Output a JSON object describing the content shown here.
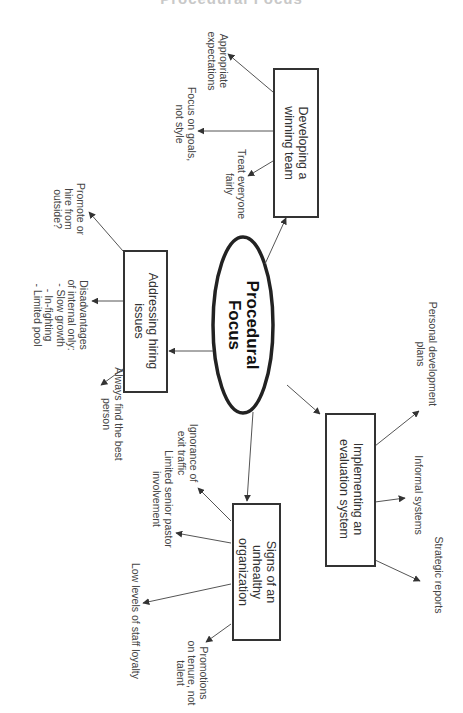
{
  "header": {
    "title": "Procedural Focus"
  },
  "center": {
    "label": "Procedural\nFocus"
  },
  "branches": [
    {
      "label": "Developing a\nwinning team",
      "leaves": [
        "Appropriate\nexpectations",
        "Focus on goals,\nnot style",
        "Treat everyone\nfairly"
      ]
    },
    {
      "label": "Addressing hiring\nissues",
      "leaves": [
        "Promote or\nhire from\noutside?",
        "Disadvantages\nof internal only:\n- Slow growth\n- In-fighting\n- Limited pool",
        "Always find the best\nperson"
      ]
    },
    {
      "label": "Implementing an\nevaluation system",
      "leaves": [
        "Personal development\nplans",
        "Informal systems",
        "Strategic reports"
      ]
    },
    {
      "label": "Signs of an\nunhealthy\norganization",
      "leaves": [
        "Ignorance of\nexit traffic",
        "Limited senior pastor\ninvolvement",
        "Low levels of staff loyalty",
        "Promotions\non tenure, not\ntalent"
      ]
    }
  ],
  "colors": {
    "stroke": "#333333",
    "text": "#3a3a3a",
    "background": "#ffffff"
  }
}
